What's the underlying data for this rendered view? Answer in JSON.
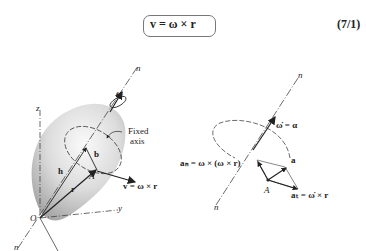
{
  "equation": {
    "text": "v = ω × r",
    "number": "(7/1)"
  },
  "left_figure": {
    "labels": {
      "n_top": "n",
      "n_bottom": "n",
      "omega": "ω",
      "z": "z",
      "fixed_axis": "Fixed",
      "fixed_axis2": "axis",
      "b": "b",
      "h": "h",
      "A": "A",
      "r": "r",
      "v": "v = ω × r",
      "O": "O",
      "y": "y"
    }
  },
  "right_figure": {
    "labels": {
      "n_top": "n",
      "n_bottom": "n",
      "alpha": "ω̇ = α",
      "an": "aₙ = ω × (ω × r)",
      "a": "a",
      "A": "A",
      "at": "aₜ = ω̇ × r"
    }
  },
  "colors": {
    "ink": "#222222",
    "body_fill": "#c9c9c9",
    "body_light": "#f2f2f2"
  }
}
